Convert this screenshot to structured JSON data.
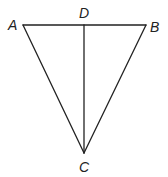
{
  "diagram": {
    "type": "geometry-triangle",
    "colors": {
      "stroke": "#222222",
      "background": "#ffffff"
    },
    "points": {
      "A": {
        "label": "A",
        "x": 23,
        "y": 25,
        "label_x": 8,
        "label_y": 30
      },
      "B": {
        "label": "B",
        "x": 146,
        "y": 25,
        "label_x": 150,
        "label_y": 32
      },
      "C": {
        "label": "C",
        "x": 84,
        "y": 153,
        "label_x": 79,
        "label_y": 172
      },
      "D": {
        "label": "D",
        "x": 84,
        "y": 25,
        "label_x": 79,
        "label_y": 18
      }
    },
    "segments": [
      {
        "name": "AB",
        "from": "A",
        "to": "B"
      },
      {
        "name": "AC",
        "from": "A",
        "to": "C"
      },
      {
        "name": "BC",
        "from": "B",
        "to": "C"
      },
      {
        "name": "DC",
        "from": "D",
        "to": "C"
      }
    ]
  }
}
